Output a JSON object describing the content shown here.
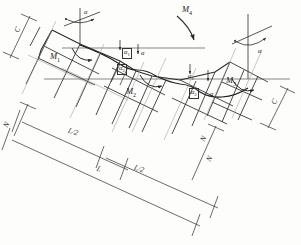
{
  "figure": {
    "type": "engineering-line-drawing",
    "background_color": "#ffffff",
    "line_color": "#2b2b2b",
    "construction_line_color": "#8a8a8a"
  },
  "moment_labels": [
    {
      "id": "m1",
      "text": "M",
      "sub": "1",
      "x": 50,
      "y": 57
    },
    {
      "id": "m2",
      "text": "M",
      "sub": "2",
      "x": 126,
      "y": 92
    },
    {
      "id": "m3",
      "text": "M",
      "sub": "3",
      "x": 226,
      "y": 81
    },
    {
      "id": "m4",
      "text": "M",
      "sub": "4",
      "x": 182,
      "y": 10
    }
  ],
  "angle_labels": [
    {
      "id": "alpha-top-left",
      "text": "α",
      "sub": "",
      "x": 84,
      "y": 13,
      "boxed": false
    },
    {
      "id": "alpha1-left",
      "text": "α",
      "sub": "1",
      "x": 124,
      "y": 52,
      "boxed": true
    },
    {
      "id": "alpha-mid-left",
      "text": "α",
      "sub": "",
      "x": 141,
      "y": 54,
      "boxed": false
    },
    {
      "id": "alpha2-left",
      "text": "α",
      "sub": "2",
      "x": 120,
      "y": 68,
      "boxed": true
    },
    {
      "id": "alpha1-right",
      "text": "α",
      "sub": "1",
      "x": 190,
      "y": 77,
      "boxed": false
    },
    {
      "id": "alpha2-right",
      "text": "α",
      "sub": "2",
      "x": 192,
      "y": 92,
      "boxed": true
    },
    {
      "id": "alpha-mid-right",
      "text": "α",
      "sub": "",
      "x": 210,
      "y": 94,
      "boxed": false
    },
    {
      "id": "alpha-top-right",
      "text": "α",
      "sub": "",
      "x": 258,
      "y": 52,
      "boxed": false
    }
  ],
  "dimension_labels": [
    {
      "id": "c-left",
      "text": "C",
      "x": 17,
      "y": 29,
      "rot": -63
    },
    {
      "id": "c-right",
      "text": "C",
      "x": 274,
      "y": 101,
      "rot": -63
    },
    {
      "id": "n-left",
      "text": "N",
      "x": 6,
      "y": 124,
      "rot": -63
    },
    {
      "id": "n-mid",
      "text": "N",
      "x": 203,
      "y": 138,
      "rot": -63
    },
    {
      "id": "n-low",
      "text": "N",
      "x": 209,
      "y": 158,
      "rot": -63
    },
    {
      "id": "l-half-1",
      "text": "L/2",
      "x": 72,
      "y": 131,
      "rot": 20
    },
    {
      "id": "l-half-2",
      "text": "L/2",
      "x": 138,
      "y": 168,
      "rot": 20
    },
    {
      "id": "l-total",
      "text": "L",
      "x": 99,
      "y": 168,
      "rot": 20
    }
  ]
}
